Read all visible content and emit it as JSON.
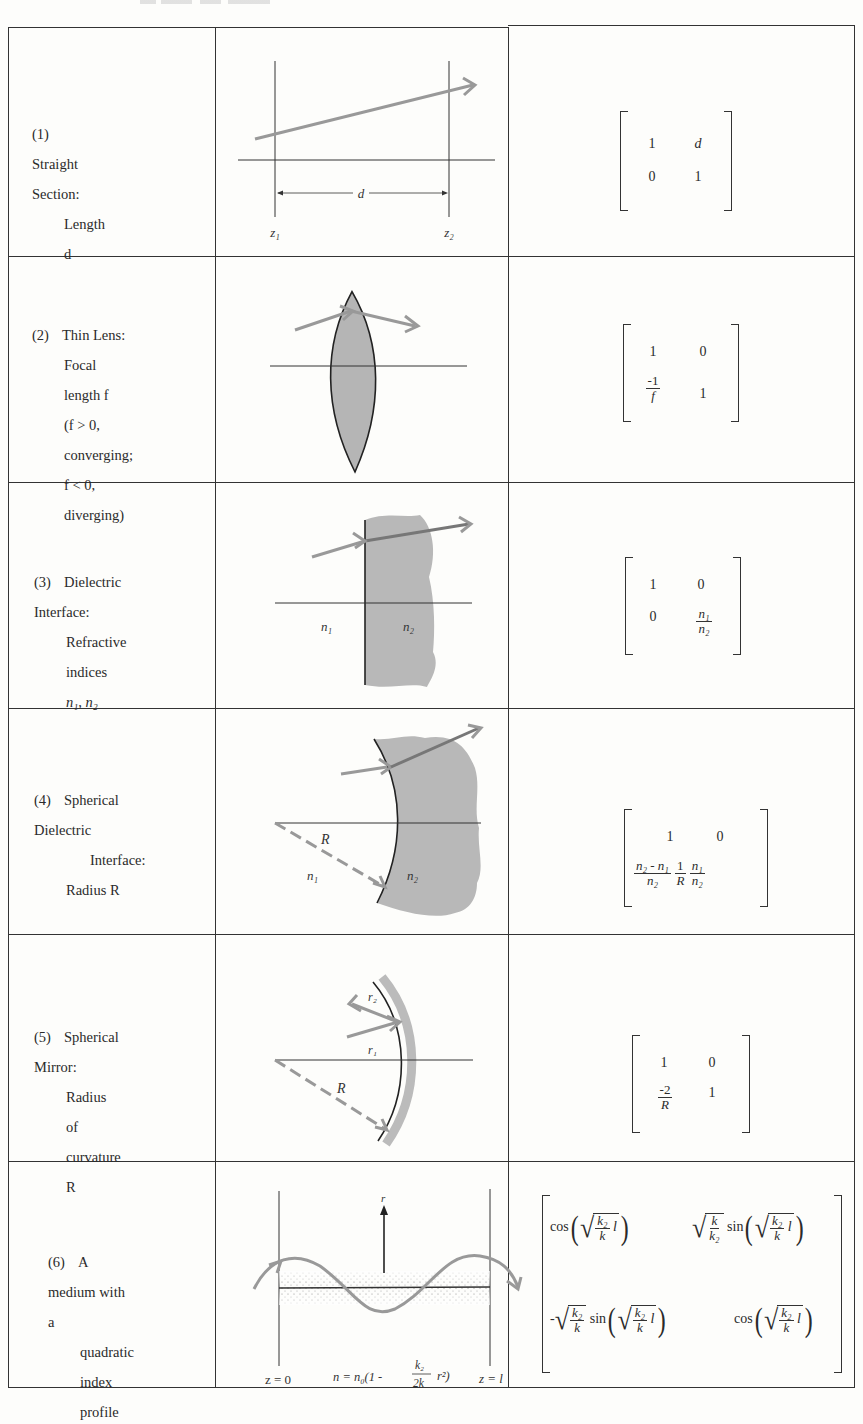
{
  "table": {
    "rows": [
      {
        "number": "(1)",
        "title": "Straight Section:",
        "lines": [
          "Length d"
        ],
        "diagram": {
          "labels": {
            "z1": "z₁",
            "z2": "z₂",
            "d": "d"
          }
        },
        "matrix": {
          "a": "1",
          "b": "d",
          "c": "0",
          "d": "1"
        }
      },
      {
        "number": "(2)",
        "title": "Thin Lens:",
        "lines": [
          "Focal length f",
          "(f > 0, converging;",
          "f < 0, diverging)"
        ],
        "matrix": {
          "a": "1",
          "b": "0",
          "c_num": "-1",
          "c_den": "f",
          "d": "1"
        }
      },
      {
        "number": "(3)",
        "title": "Dielectric Interface:",
        "lines": [
          "Refractive indices",
          "n₁, n₂"
        ],
        "diagram": {
          "labels": {
            "n1": "n₁",
            "n2": "n₂"
          }
        },
        "matrix": {
          "a": "1",
          "b": "0",
          "c": "0",
          "d_num": "n₁",
          "d_den": "n₂"
        }
      },
      {
        "number": "(4)",
        "title": "Spherical Dielectric",
        "lines": [
          "Interface:",
          "Radius R"
        ],
        "diagram": {
          "labels": {
            "R": "R",
            "n1": "n₁",
            "n2": "n₂"
          }
        },
        "matrix": {
          "a": "1",
          "b": "0",
          "c1_num": "n₂ - n₁",
          "c1_den": "n₂",
          "c2_num": "1",
          "c2_den": "R",
          "d_num": "n₁",
          "d_den": "n₂"
        }
      },
      {
        "number": "(5)",
        "title": "Spherical Mirror:",
        "lines": [
          "Radius of curvature R"
        ],
        "diagram": {
          "labels": {
            "r1": "r₁",
            "r2": "r₂",
            "R": "R"
          }
        },
        "matrix": {
          "a": "1",
          "b": "0",
          "c_num": "-2",
          "c_den": "R",
          "d": "1"
        }
      },
      {
        "number": "(6)",
        "title": "A medium with a",
        "lines": [
          "quadratic index",
          "profile"
        ],
        "diagram": {
          "labels": {
            "r": "r",
            "z0": "z = 0",
            "zl": "z = l",
            "formula_prefix": "n = n₀(1 -",
            "formula_num": "k₂",
            "formula_den": "2k",
            "formula_suffix": "r²)"
          }
        },
        "matrix": {
          "cos": "cos",
          "sin": "sin",
          "minus": "-",
          "k2": "k₂",
          "k": "k",
          "l": "l"
        }
      }
    ]
  }
}
